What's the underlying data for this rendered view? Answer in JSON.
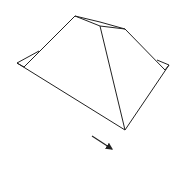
{
  "diagram": {
    "type": "line-drawing",
    "stroke_color": "#222222",
    "background": "#ffffff",
    "vertices": {
      "peak": [
        75,
        16
      ],
      "ridge_mid": [
        100,
        26
      ],
      "ridge_end": [
        125,
        29
      ],
      "left_outer": [
        17,
        63
      ],
      "left_inner": [
        24,
        67
      ],
      "left_eave": [
        39,
        51
      ],
      "right_outer": [
        169,
        65
      ],
      "right_inner": [
        165,
        70
      ],
      "right_eave": [
        157,
        60
      ],
      "bottom": [
        125,
        130
      ]
    },
    "arrow": {
      "from": [
        92,
        136
      ],
      "to": [
        113,
        150
      ],
      "direction": "down-right"
    }
  }
}
